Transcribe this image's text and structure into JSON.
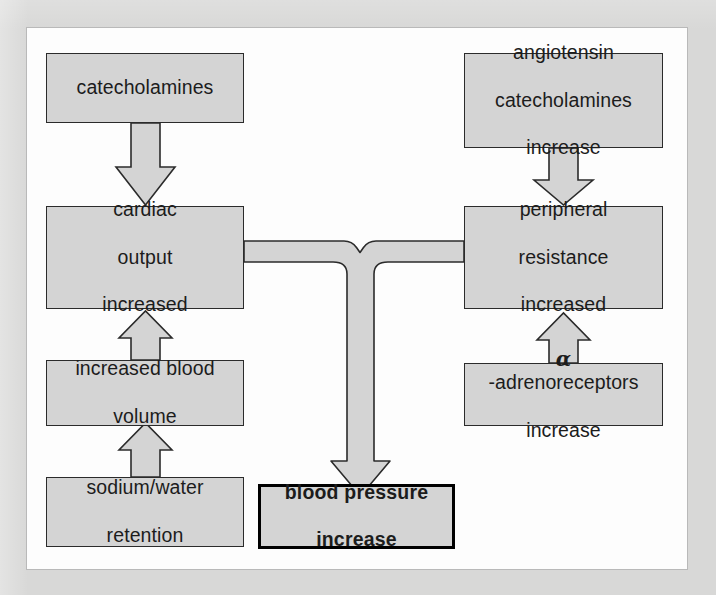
{
  "diagram": {
    "colors": {
      "page_background": "#d8d8d7",
      "panel_background": "#fdfdfd",
      "box_fill": "#d4d4d4",
      "box_border": "#2b2b2b",
      "emphasis_border": "#000000",
      "text": "#1c1c1c"
    },
    "nodes": [
      {
        "id": "catecholamines",
        "label": "catecholamines",
        "lines": [
          "catecholamines"
        ]
      },
      {
        "id": "angiotensin",
        "label": "angiotensin catecholamines increase",
        "lines": [
          "angiotensin",
          "catecholamines",
          "increase"
        ]
      },
      {
        "id": "cardiac_output",
        "label": "cardiac output increased",
        "lines": [
          "cardiac",
          "output",
          "increased"
        ]
      },
      {
        "id": "peripheral",
        "label": "peripheral resistance increased",
        "lines": [
          "peripheral",
          "resistance",
          "increased"
        ]
      },
      {
        "id": "blood_volume",
        "label": "increased blood volume",
        "lines": [
          "increased blood",
          "volume"
        ]
      },
      {
        "id": "adrenoreceptors",
        "label": "α-adrenoreceptors increase",
        "lines": [
          "α-adrenoreceptors",
          "increase"
        ],
        "symbol": "α",
        "rest_line1": "-adrenoreceptors"
      },
      {
        "id": "sodium_water",
        "label": "sodium/water retention",
        "lines": [
          "sodium/water",
          "retention"
        ]
      },
      {
        "id": "blood_pressure",
        "label": "blood pressure increase",
        "lines": [
          "blood pressure",
          "increase"
        ],
        "emphasis": true
      }
    ],
    "edges": [
      {
        "from": "catecholamines",
        "to": "cardiac_output",
        "direction": "down",
        "style": "block-arrow"
      },
      {
        "from": "angiotensin",
        "to": "peripheral",
        "direction": "down",
        "style": "block-arrow"
      },
      {
        "from": "blood_volume",
        "to": "cardiac_output",
        "direction": "up",
        "style": "block-arrow"
      },
      {
        "from": "sodium_water",
        "to": "blood_volume",
        "direction": "up",
        "style": "block-arrow"
      },
      {
        "from": "adrenoreceptors",
        "to": "peripheral",
        "direction": "up",
        "style": "block-arrow"
      },
      {
        "from": "cardiac_output",
        "to": "blood_pressure",
        "direction": "down",
        "style": "merge-junction"
      },
      {
        "from": "peripheral",
        "to": "blood_pressure",
        "direction": "down",
        "style": "merge-junction"
      }
    ]
  }
}
